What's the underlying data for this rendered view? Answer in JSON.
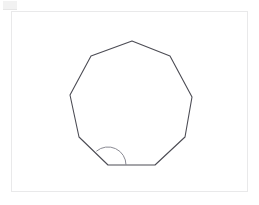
{
  "figure": {
    "name": "nonagon-with-marked-angle",
    "shape_label": "nonagon",
    "sides": 9,
    "background_color": "#ffffff",
    "frame": {
      "name": "figure-frame",
      "border_color": "#e9e9ea",
      "fill_color": "#ffffff",
      "x": 11,
      "y": 11,
      "width": 237,
      "height": 181
    },
    "polygon": {
      "name": "nonagon-outline",
      "stroke_color": "#4c4c54",
      "fill_color": "#ffffff",
      "stroke_width": 1.1,
      "points": "132,41 170,56 192,97 185,137 155,165 108,165 79,137 70,95 91,56",
      "vertices": [
        {
          "label": "top",
          "x": 132,
          "y": 41
        },
        {
          "label": "upper-right",
          "x": 170,
          "y": 56
        },
        {
          "label": "right",
          "x": 192,
          "y": 97
        },
        {
          "label": "lower-right",
          "x": 185,
          "y": 137
        },
        {
          "label": "bottom-right",
          "x": 155,
          "y": 165
        },
        {
          "label": "bottom-left",
          "x": 108,
          "y": 165
        },
        {
          "label": "lower-left",
          "x": 79,
          "y": 137
        },
        {
          "label": "left",
          "x": 70,
          "y": 95
        },
        {
          "label": "upper-left",
          "x": 91,
          "y": 56
        }
      ]
    },
    "angle_marker": {
      "name": "interior-angle-arc",
      "stroke_color": "#8a8a93",
      "at_vertex": "bottom-left",
      "center_x": 108,
      "center_y": 165,
      "radius": 18,
      "path": "M 126 165 A 18 18 0 0 0 96.4 151.2"
    },
    "corner_artifact": {
      "name": "corner-artifact",
      "color": "#f2f2f2"
    }
  }
}
